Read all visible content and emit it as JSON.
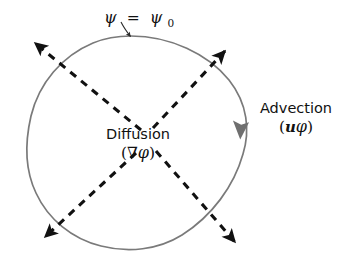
{
  "figure": {
    "background_color": "#ffffff",
    "width": 341,
    "height": 264
  },
  "contour": {
    "name": "iso-streamline-contour",
    "stroke_color": "#7a7a7a",
    "stroke_width": 1.6,
    "bounds": {
      "left": 28,
      "top": 36,
      "right": 248,
      "bottom": 250
    }
  },
  "labels": {
    "contour_value": {
      "psi_symbol": "ψ",
      "equals": "=",
      "psi_base": "ψ",
      "subscript": "0",
      "full_text": "ψ = ψ₀",
      "x": 110,
      "y": 20
    },
    "diffusion": {
      "name": "Diffusion",
      "operator_text": "(∇φ)",
      "nabla": "∇",
      "phi": "φ",
      "x": 138,
      "y": 136
    },
    "advection": {
      "name": "Advection",
      "operator_text": "(uφ)",
      "u": "u",
      "phi": "φ",
      "x": 295,
      "y": 110
    }
  },
  "arrows": {
    "diffusion_color": "#111111",
    "advection_color": "#6f6f6f",
    "dash_pattern": "7,6",
    "diffusion_flux": [
      {
        "name": "diffusion-arrow-top-left",
        "direction": "up-left",
        "from_x": 139,
        "from_y": 131,
        "to_x": 34,
        "to_y": 42
      },
      {
        "name": "diffusion-arrow-top-right",
        "direction": "up-right",
        "from_x": 152,
        "from_y": 128,
        "to_x": 226,
        "to_y": 50
      },
      {
        "name": "diffusion-arrow-bottom-left",
        "direction": "down-left",
        "from_x": 135,
        "from_y": 152,
        "to_x": 44,
        "to_y": 238
      },
      {
        "name": "diffusion-arrow-bottom-right",
        "direction": "down-right",
        "from_x": 155,
        "from_y": 150,
        "to_x": 236,
        "to_y": 243
      }
    ],
    "advection_tangent": {
      "name": "advection-arrowhead",
      "x": 241,
      "y": 127,
      "direction": "counter-clockwise-upward"
    },
    "contour_pointer": {
      "name": "contour-pointer-arrow",
      "from_x": 124,
      "from_y": 24,
      "to_x": 131,
      "to_y": 37
    }
  }
}
